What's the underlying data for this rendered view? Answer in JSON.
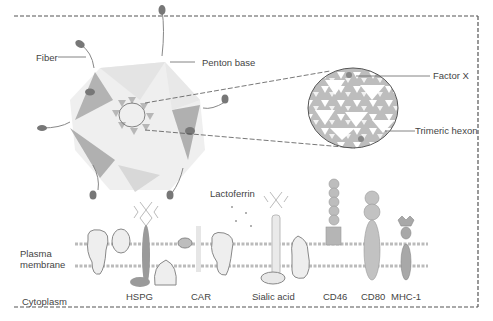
{
  "figure": {
    "type": "diagram",
    "colors": {
      "border": "#555555",
      "capsid_dark": "#9a9a9a",
      "capsid_light": "#dcdcdc",
      "membrane": "#b8b8b8",
      "text": "#444444"
    }
  },
  "virus": {
    "labels": {
      "fiber": "Fiber",
      "penton_base": "Penton base"
    }
  },
  "magnified_inset": {
    "labels": {
      "factor_x": "Factor X",
      "trimeric_hexon": "Trimeric hexon"
    }
  },
  "cell": {
    "labels": {
      "plasma_membrane_line1": "Plasma",
      "plasma_membrane_line2": "membrane",
      "cytoplasm": "Cytoplasm",
      "lactoferrin": "Lactoferrin"
    },
    "receptors": [
      {
        "id": "hspg",
        "label": "HSPG"
      },
      {
        "id": "car",
        "label": "CAR"
      },
      {
        "id": "sialic_acid",
        "label": "Sialic acid"
      },
      {
        "id": "cd46",
        "label": "CD46"
      },
      {
        "id": "cd80",
        "label": "CD80"
      },
      {
        "id": "mhc1",
        "label": "MHC-1"
      }
    ]
  }
}
